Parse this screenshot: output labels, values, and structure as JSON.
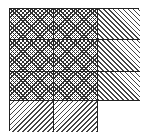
{
  "diagram": {
    "type": "pattern-grid",
    "rows": 4,
    "columns": 3,
    "cells": [
      [
        "crosshatch",
        "crosshatch",
        "back-hatch"
      ],
      [
        "crosshatch",
        "crosshatch",
        "back-hatch"
      ],
      [
        "crosshatch",
        "crosshatch",
        "back-hatch"
      ],
      [
        "fwd-hatch",
        "fwd-hatch",
        "blank"
      ]
    ],
    "colors": {
      "line": "#222222",
      "background": "#ffffff"
    }
  }
}
